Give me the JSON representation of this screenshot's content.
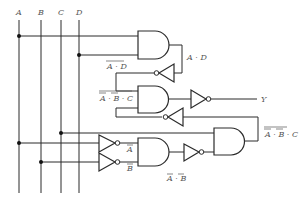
{
  "diagram": {
    "type": "logic-circuit",
    "inputs": [
      {
        "name": "A",
        "x": 19
      },
      {
        "name": "B",
        "x": 41
      },
      {
        "name": "C",
        "x": 61
      },
      {
        "name": "D",
        "x": 79
      }
    ],
    "output": {
      "name": "Y"
    },
    "labels": {
      "and1_out": "A · D",
      "inv1_out": "A · D",
      "and2_in_top": "A · B · C",
      "and3_out": "A · B · C",
      "inv_a_out": "A",
      "inv_b_out": "B",
      "and4_out": "A · B",
      "y": "Y"
    },
    "gates": [
      {
        "id": "and1",
        "type": "AND",
        "inputs": [
          "A",
          "D"
        ],
        "output": "A·D"
      },
      {
        "id": "inv1",
        "type": "NOT",
        "input": "A·D",
        "output": "NOT(A·D)"
      },
      {
        "id": "inv_a",
        "type": "NOT",
        "input": "A",
        "output": "NOT A"
      },
      {
        "id": "inv_b",
        "type": "NOT",
        "input": "B",
        "output": "NOT B"
      },
      {
        "id": "and4",
        "type": "AND",
        "inputs": [
          "NOT A",
          "NOT B"
        ],
        "output": "NOT A · NOT B"
      },
      {
        "id": "inv4",
        "type": "NOT",
        "input": "NOT A · NOT B",
        "output": "NOT(NOT A · NOT B)"
      },
      {
        "id": "and3",
        "type": "AND",
        "inputs": [
          "C",
          "NOT(NOT A · NOT B)"
        ],
        "output": "NOT(NOT A·NOT B)·C"
      },
      {
        "id": "inv3",
        "type": "NOT",
        "input": "NOT(NOT A·NOT B)·C",
        "output": "NOT(NOT(NOT A·NOT B)·C)"
      },
      {
        "id": "and2",
        "type": "AND",
        "inputs": [
          "NOT(A·D)",
          "NOT(NOT(NOT A·NOT B)·C)"
        ],
        "output": "and2_out"
      },
      {
        "id": "inv2",
        "type": "NOT",
        "input": "and2_out",
        "output": "Y"
      }
    ]
  }
}
